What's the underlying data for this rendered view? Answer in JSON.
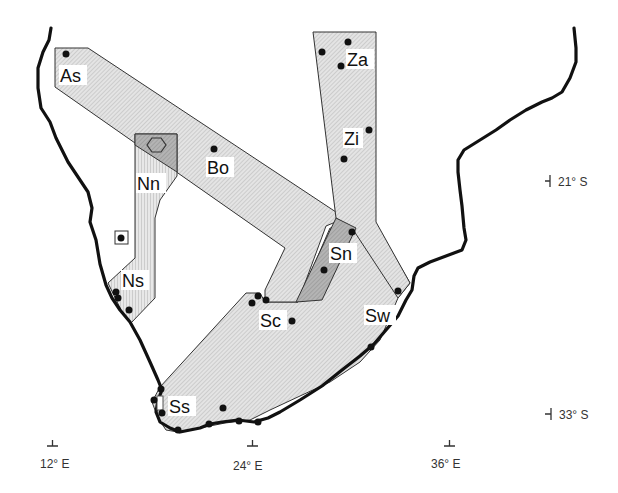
{
  "map": {
    "title": "",
    "colors": {
      "coastline": "#111111",
      "region_fill_light": "#dcdcdc",
      "region_fill_dark": "#a9a9a9",
      "site_marker": "#111111"
    },
    "regions": [
      {
        "code": "As",
        "label": "As",
        "pattern": "diagonal-hatch"
      },
      {
        "code": "Bo",
        "label": "Bo",
        "pattern": "diagonal-hatch"
      },
      {
        "code": "Nn",
        "label": "Nn",
        "pattern": "vertical-hatch"
      },
      {
        "code": "Ns",
        "label": "Ns",
        "pattern": "vertical-hatch"
      },
      {
        "code": "Za",
        "label": "Za",
        "pattern": "diagonal-hatch"
      },
      {
        "code": "Zi",
        "label": "Zi",
        "pattern": "diagonal-hatch"
      },
      {
        "code": "Sn",
        "label": "Sn",
        "pattern": "dark-hatch"
      },
      {
        "code": "Sc",
        "label": "Sc",
        "pattern": "diagonal-hatch"
      },
      {
        "code": "Sw",
        "label": "Sw",
        "pattern": "diagonal-hatch"
      },
      {
        "code": "Ss",
        "label": "Ss",
        "pattern": "diagonal-hatch"
      }
    ],
    "special_markers": [
      {
        "type": "hexagon",
        "region": "Nn"
      },
      {
        "type": "boxed-site",
        "region": "Ns"
      },
      {
        "type": "small-box",
        "region": "Ss"
      }
    ],
    "axes": {
      "longitude_labels": [
        "12° E",
        "24° E",
        "36° E"
      ],
      "latitude_labels": [
        "21° S",
        "33° S"
      ]
    }
  }
}
